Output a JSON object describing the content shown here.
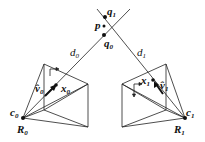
{
  "diagram": {
    "type": "two-view triangulation",
    "colors": {
      "line": "#222222",
      "background": "#ffffff"
    },
    "labels": {
      "q1": {
        "base": "q",
        "sub": "1"
      },
      "p": {
        "base": "p"
      },
      "q0": {
        "base": "q",
        "sub": "0"
      },
      "d0": {
        "base": "d",
        "sub": "0"
      },
      "d1": {
        "base": "d",
        "sub": "1"
      },
      "x0": {
        "base": "x",
        "sub": "0"
      },
      "x1": {
        "base": "x",
        "sub": "1"
      },
      "v0": {
        "base": "v̂",
        "sub": "0"
      },
      "v1": {
        "base": "v̂",
        "sub": "1"
      },
      "c0": {
        "base": "c",
        "sub": "0"
      },
      "c1": {
        "base": "c",
        "sub": "1"
      },
      "R0": {
        "base": "R",
        "sub": "0"
      },
      "R1": {
        "base": "R",
        "sub": "1"
      }
    }
  }
}
